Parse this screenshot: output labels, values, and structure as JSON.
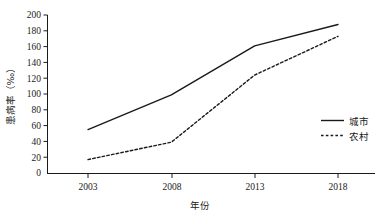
{
  "chart_data": {
    "type": "line",
    "title": "",
    "xlabel": "年份",
    "ylabel": "患病率（‰）",
    "categories": [
      "2003",
      "2008",
      "2013",
      "2018"
    ],
    "x": [
      2003,
      2008,
      2013,
      2018
    ],
    "series": [
      {
        "name": "城市",
        "style": "solid",
        "color": "#1a1a1a",
        "values": [
          55,
          99,
          161,
          188
        ]
      },
      {
        "name": "农村",
        "style": "dashed",
        "color": "#1a1a1a",
        "values": [
          17,
          39,
          124,
          173
        ]
      }
    ],
    "xlim": [
      2001,
      2020
    ],
    "ylim": [
      0,
      200
    ],
    "ytick_labels": [
      "0",
      "20",
      "40",
      "60",
      "80",
      "100",
      "120",
      "140",
      "160",
      "180",
      "200"
    ],
    "ytick_values": [
      0,
      20,
      40,
      60,
      80,
      100,
      120,
      140,
      160,
      180,
      200
    ],
    "xtick_labels": [
      "2003",
      "2008",
      "2013",
      "2018"
    ],
    "grid": false,
    "legend_position": "center-right"
  },
  "axes": {
    "y_title": "患病率（‰）",
    "x_title": "年份",
    "y_ticks": [
      {
        "label": "200"
      },
      {
        "label": "180"
      },
      {
        "label": "160"
      },
      {
        "label": "140"
      },
      {
        "label": "120"
      },
      {
        "label": "100"
      },
      {
        "label": "80"
      },
      {
        "label": "60"
      },
      {
        "label": "40"
      },
      {
        "label": "20"
      },
      {
        "label": "0"
      }
    ],
    "x_ticks": [
      {
        "label": "2003"
      },
      {
        "label": "2008"
      },
      {
        "label": "2013"
      },
      {
        "label": "2018"
      }
    ]
  },
  "legend": {
    "entries": [
      {
        "label": "城市",
        "style": "solid"
      },
      {
        "label": "农村",
        "style": "dashed"
      }
    ]
  }
}
